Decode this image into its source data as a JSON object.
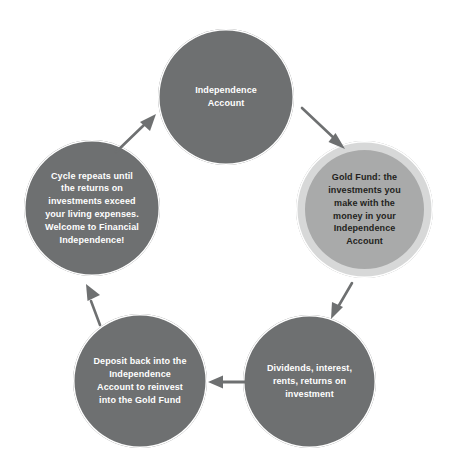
{
  "diagram": {
    "type": "cycle",
    "background_color": "#ffffff",
    "node_fill_dark": "#6e7071",
    "node_fill_light": "#a9aaaa",
    "node_ring_color": "#ffffff",
    "node_outer_band_color": "#d7d8d8",
    "arrow_color": "#6e7071",
    "nodes": [
      {
        "id": "independence-account",
        "label": "Independence\nAccount",
        "style": "dark",
        "position": "top",
        "font_size_px": 9
      },
      {
        "id": "gold-fund",
        "label": "Gold Fund: the\ninvestments you\nmake with the\nmoney in your\nIndependence\nAccount",
        "style": "light",
        "position": "right",
        "font_size_px": 9
      },
      {
        "id": "returns",
        "label": "Dividends, interest,\nrents, returns on\ninvestment",
        "style": "dark",
        "position": "bottom-right",
        "font_size_px": 9
      },
      {
        "id": "deposit-back",
        "label": "Deposit back into the\nIndependence\nAccount to reinvest\ninto the Gold Fund",
        "style": "dark",
        "position": "bottom-left",
        "font_size_px": 9
      },
      {
        "id": "cycle-repeats",
        "label": "Cycle repeats until\nthe returns on\ninvestments exceed\nyour living expenses.\nWelcome to Financial\nIndependence!",
        "style": "dark",
        "position": "left",
        "font_size_px": 9
      }
    ],
    "arrows": [
      {
        "id": "arrow-account-to-goldfund",
        "from": "independence-account",
        "to": "gold-fund",
        "direction": "down-right"
      },
      {
        "id": "arrow-goldfund-to-returns",
        "from": "gold-fund",
        "to": "returns",
        "direction": "down-left"
      },
      {
        "id": "arrow-returns-to-deposit",
        "from": "returns",
        "to": "deposit-back",
        "direction": "left"
      },
      {
        "id": "arrow-deposit-to-cycle",
        "from": "deposit-back",
        "to": "cycle-repeats",
        "direction": "up-right"
      },
      {
        "id": "arrow-cycle-to-account",
        "from": "cycle-repeats",
        "to": "independence-account",
        "direction": "up-right"
      }
    ]
  }
}
